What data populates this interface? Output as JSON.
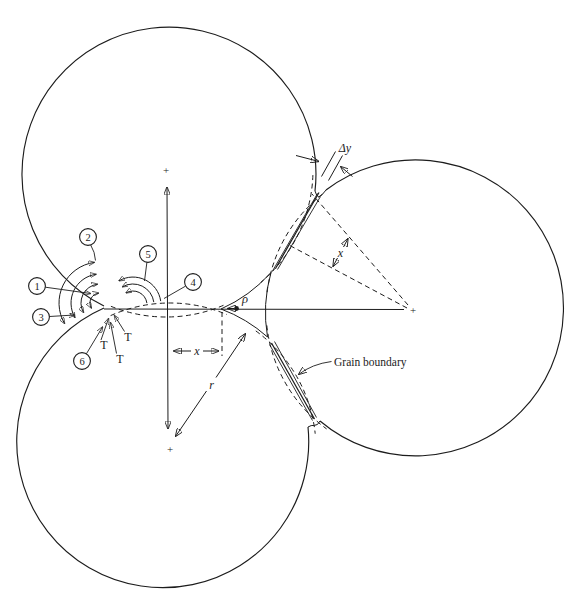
{
  "figure": {
    "background": "#ffffff",
    "ink_color": "#1c1c1c",
    "callouts": [
      {
        "label": "1"
      },
      {
        "label": "2"
      },
      {
        "label": "3"
      },
      {
        "label": "4"
      },
      {
        "label": "5"
      },
      {
        "label": "6"
      }
    ],
    "surface_tension_labels": [
      "T",
      "T",
      "T"
    ],
    "center_marks": [
      "+",
      "+",
      "+"
    ],
    "measurements": {
      "gap": "Δy",
      "neck_half_width_upper": "x",
      "neck_half_width_lower": "x",
      "grain_radius": "r",
      "pore_curvature_radius": "ρ"
    },
    "annotations": {
      "grain_boundary_label": "Grain boundary"
    }
  }
}
